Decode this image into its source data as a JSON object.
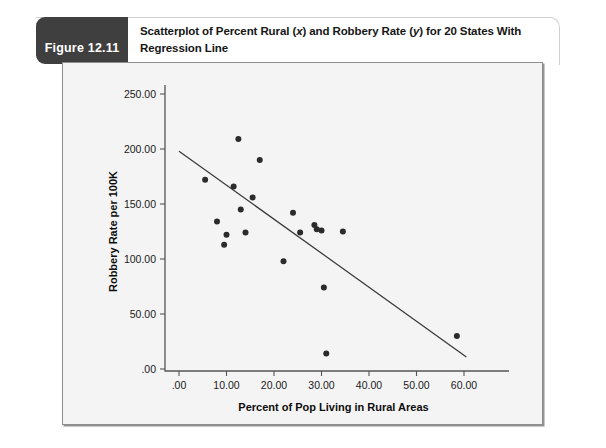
{
  "figure": {
    "tag_label": "Figure 12.11",
    "caption_line1_a": "Scatterplot of Percent Rural (",
    "caption_x": "x",
    "caption_line1_b": ") and Robbery Rate (",
    "caption_y": "y",
    "caption_line1_c": ") for 20 States With",
    "caption_line2": "Regression Line",
    "tag_bg": "#3f3f3f",
    "panel_bg": "#f4f4f4",
    "point_color": "#2b2b2b",
    "line_color": "#3a3a3a"
  },
  "chart_data": {
    "type": "scatter",
    "title": "Scatterplot of Percent Rural (x) and Robbery Rate (y) for 20 States With Regression Line",
    "xlabel": "Percent of Pop Living in Rural Areas",
    "ylabel": "Robbery Rate per 100K",
    "xlim": [
      -2,
      63
    ],
    "ylim": [
      -12,
      262
    ],
    "xticks": [
      0,
      10,
      20,
      30,
      40,
      50,
      60
    ],
    "xticklabels": [
      ".00",
      "10.00",
      "20.00",
      "30.00",
      "40.00",
      "50.00",
      "60.00"
    ],
    "yticks": [
      0,
      50,
      100,
      150,
      200,
      250
    ],
    "yticklabels": [
      ".00",
      "50.00",
      "100.00",
      "150.00",
      "200.00",
      "250.00"
    ],
    "grid": false,
    "legend": "none",
    "x": [
      5.5,
      8.0,
      9.5,
      10.0,
      11.5,
      12.5,
      13.0,
      14.0,
      15.5,
      17.0,
      22.0,
      24.0,
      25.5,
      28.5,
      29.0,
      30.0,
      30.5,
      31.0,
      34.5,
      58.5
    ],
    "y": [
      172.0,
      134.0,
      113.0,
      122.0,
      166.0,
      209.0,
      145.0,
      124.0,
      156.0,
      190.0,
      98.0,
      142.0,
      124.0,
      131.0,
      127.0,
      126.0,
      74.0,
      14.0,
      125.0,
      30.0
    ],
    "series": [
      {
        "name": "States",
        "points": [
          [
            5.5,
            172.0
          ],
          [
            8.0,
            134.0
          ],
          [
            9.5,
            113.0
          ],
          [
            10.0,
            122.0
          ],
          [
            11.5,
            166.0
          ],
          [
            12.5,
            209.0
          ],
          [
            13.0,
            145.0
          ],
          [
            14.0,
            124.0
          ],
          [
            15.5,
            156.0
          ],
          [
            17.0,
            190.0
          ],
          [
            22.0,
            98.0
          ],
          [
            24.0,
            142.0
          ],
          [
            25.5,
            124.0
          ],
          [
            28.5,
            131.0
          ],
          [
            29.0,
            127.0
          ],
          [
            30.0,
            126.0
          ],
          [
            30.5,
            74.0
          ],
          [
            31.0,
            14.0
          ],
          [
            34.5,
            125.0
          ],
          [
            58.5,
            30.0
          ]
        ]
      }
    ],
    "regression_line": {
      "label": "Regression Line",
      "x_start": 0.0,
      "y_start": 198.0,
      "x_end": 60.5,
      "y_end": 11.0,
      "slope": -3.09,
      "intercept": 198.0
    }
  }
}
